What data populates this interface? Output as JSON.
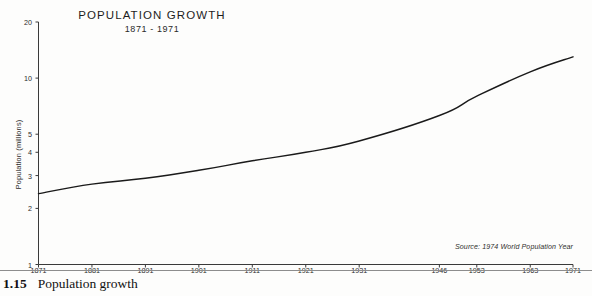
{
  "figure": {
    "caption_number": "1.15",
    "caption_text": "Population growth"
  },
  "chart_data": {
    "type": "line",
    "title": "POPULATION GROWTH",
    "subtitle": "1871 - 1971",
    "xlabel": "",
    "ylabel": "Population (millions)",
    "yscale": "log",
    "ylim": [
      1,
      20
    ],
    "ytick_values": [
      1,
      2,
      3,
      4,
      5,
      10,
      20
    ],
    "ytick_labels": [
      "1",
      "2",
      "3",
      "4",
      "5",
      "10",
      "20"
    ],
    "grid": false,
    "legend": "none",
    "source": "Source: 1974 World Population Year",
    "categories": [
      "1871",
      "1881",
      "1891",
      "1901",
      "1911",
      "1921",
      "1931",
      "1946",
      "1953",
      "1963",
      "1971"
    ],
    "x": [
      1871,
      1881,
      1891,
      1901,
      1911,
      1921,
      1931,
      1946,
      1953,
      1963,
      1971
    ],
    "values": [
      2.4,
      2.7,
      2.9,
      3.2,
      3.6,
      4.0,
      4.6,
      6.3,
      8.0,
      10.8,
      13.0
    ],
    "series": [
      {
        "name": "Population",
        "values": [
          2.4,
          2.7,
          2.9,
          3.2,
          3.6,
          4.0,
          4.6,
          6.3,
          8.0,
          10.8,
          13.0
        ]
      }
    ],
    "line_color": "#1a1a1a",
    "axis_color": "#3a3a3a"
  }
}
